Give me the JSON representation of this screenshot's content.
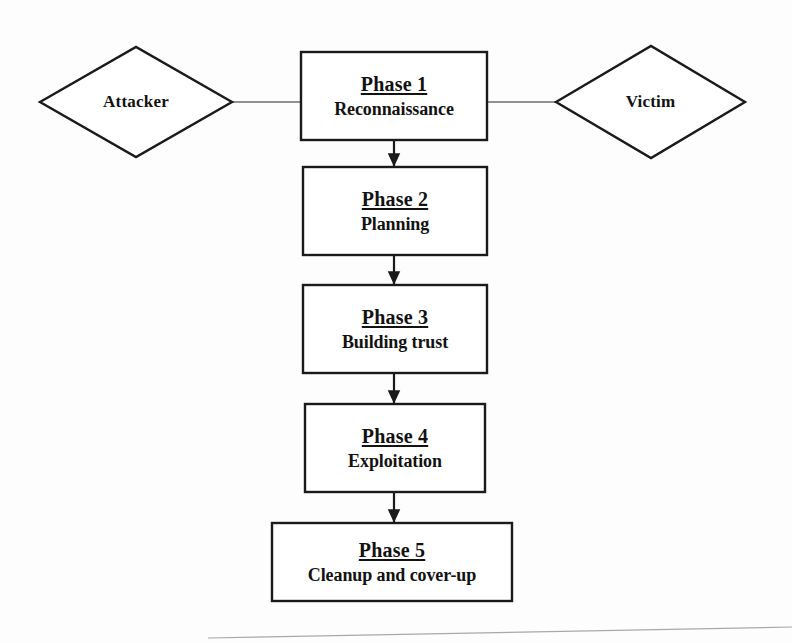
{
  "diagram": {
    "type": "flowchart",
    "background_color": "#fdfdfd",
    "stroke_color": "#1a1a1a",
    "fill_color": "#ffffff",
    "actors": [
      {
        "id": "attacker",
        "label": "Attacker",
        "shape": "diamond",
        "side": "left"
      },
      {
        "id": "victim",
        "label": "Victim",
        "shape": "diamond",
        "side": "right"
      }
    ],
    "phases": [
      {
        "id": "phase-1",
        "title": "Phase 1",
        "subtitle": "Reconnaissance"
      },
      {
        "id": "phase-2",
        "title": "Phase 2",
        "subtitle": "Planning"
      },
      {
        "id": "phase-3",
        "title": "Phase 3",
        "subtitle": "Building trust"
      },
      {
        "id": "phase-4",
        "title": "Phase 4",
        "subtitle": "Exploitation"
      },
      {
        "id": "phase-5",
        "title": "Phase 5",
        "subtitle": "Cleanup and cover-up"
      }
    ],
    "connectors": [
      {
        "id": "attacker-to-phase-1",
        "from": "attacker",
        "to": "phase-1",
        "style": "plain-line",
        "arrowhead": "none",
        "orientation": "horizontal"
      },
      {
        "id": "phase-1-to-victim",
        "from": "phase-1",
        "to": "victim",
        "style": "plain-line",
        "arrowhead": "none",
        "orientation": "horizontal"
      },
      {
        "id": "phase-1-to-phase-2",
        "from": "phase-1",
        "to": "phase-2",
        "style": "arrow",
        "arrowhead": "solid-triangle",
        "orientation": "vertical"
      },
      {
        "id": "phase-2-to-phase-3",
        "from": "phase-2",
        "to": "phase-3",
        "style": "arrow",
        "arrowhead": "solid-triangle",
        "orientation": "vertical"
      },
      {
        "id": "phase-3-to-phase-4",
        "from": "phase-3",
        "to": "phase-4",
        "style": "arrow",
        "arrowhead": "solid-triangle",
        "orientation": "vertical"
      },
      {
        "id": "phase-4-to-phase-5",
        "from": "phase-4",
        "to": "phase-5",
        "style": "arrow",
        "arrowhead": "solid-triangle",
        "orientation": "vertical"
      }
    ],
    "artifact": {
      "id": "scan-edge-line",
      "description": "faint slanted scan edge line near bottom of page"
    }
  }
}
